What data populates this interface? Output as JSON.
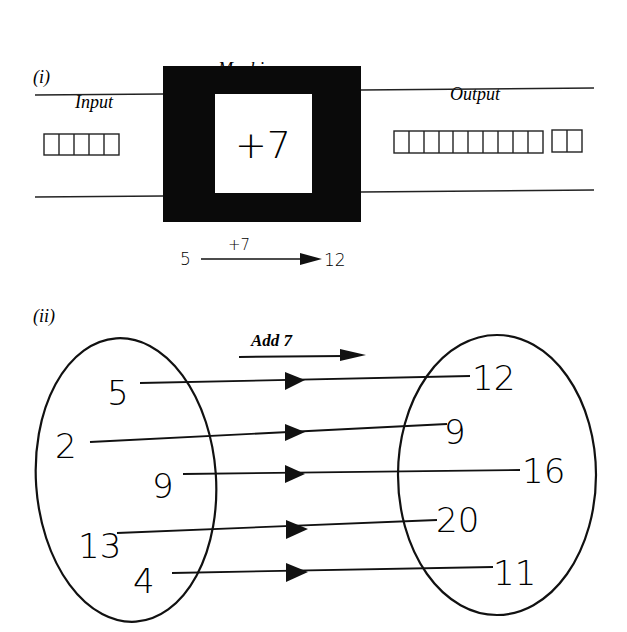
{
  "part_i": {
    "label": "(i)",
    "machine_title": "Machine",
    "input_label": "Input",
    "output_label": "Output",
    "operation": "+7",
    "input_squares": 5,
    "output_squares_groups": [
      10,
      2
    ],
    "example": {
      "from": "5",
      "op": "+7",
      "to": "12"
    }
  },
  "part_ii": {
    "label": "(ii)",
    "rule": "Add 7",
    "mappings": [
      {
        "input": "5",
        "output": "12"
      },
      {
        "input": "2",
        "output": "9"
      },
      {
        "input": "9",
        "output": "16"
      },
      {
        "input": "13",
        "output": "20"
      },
      {
        "input": "4",
        "output": "11"
      }
    ]
  }
}
